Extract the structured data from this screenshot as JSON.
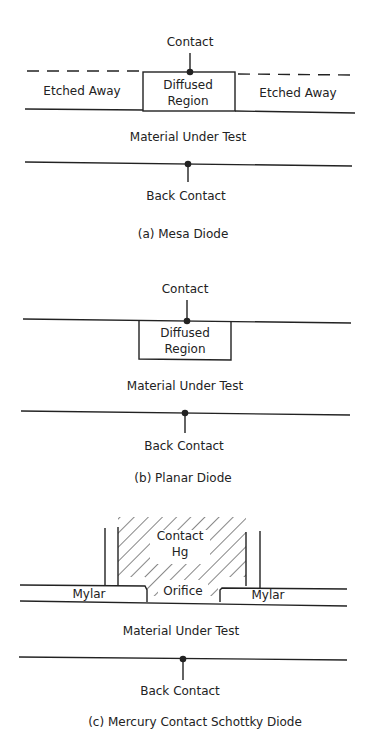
{
  "diagrams": {
    "a": {
      "contact": "Contact",
      "etched_left": "Etched Away",
      "diffused_1": "Diffused",
      "diffused_2": "Region",
      "etched_right": "Etched Away",
      "material": "Material Under Test",
      "back_contact": "Back Contact",
      "caption": "(a)  Mesa Diode"
    },
    "b": {
      "contact": "Contact",
      "diffused_1": "Diffused",
      "diffused_2": "Region",
      "material": "Material Under Test",
      "back_contact": "Back Contact",
      "caption": "(b)  Planar Diode"
    },
    "c": {
      "contact_1": "Contact",
      "contact_2": "Hg",
      "mylar_left": "Mylar",
      "orifice": "Orifice",
      "mylar_right": "Mylar",
      "material": "Material Under Test",
      "back_contact": "Back Contact",
      "caption": "(c)  Mercury Contact Schottky Diode"
    }
  }
}
